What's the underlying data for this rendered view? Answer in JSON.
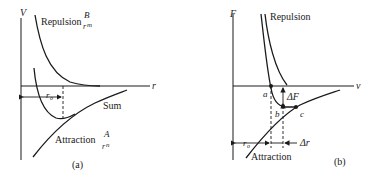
{
  "figure": {
    "panel_a": {
      "y_axis_label": "V",
      "x_axis_label": "r",
      "repulsion_label": "Repulsion",
      "repulsion_formula_num": "B",
      "repulsion_formula_den": "r",
      "repulsion_formula_exp": "m",
      "sum_label": "Sum",
      "attraction_label": "Attraction",
      "attraction_formula_num": "A",
      "attraction_formula_den": "r",
      "attraction_formula_exp": "n",
      "r0_label": "r",
      "r0_sub": "o",
      "caption": "(a)"
    },
    "panel_b": {
      "y_axis_label": "F",
      "x_axis_label": "v",
      "repulsion_label": "Repulsion",
      "attraction_label": "Attraction",
      "point_a": "a",
      "point_b": "b",
      "point_c": "c",
      "delta_f_label": "ΔF",
      "delta_r_label": "Δr",
      "r0_label": "r",
      "r0_sub": "o",
      "caption": "(b)"
    }
  }
}
